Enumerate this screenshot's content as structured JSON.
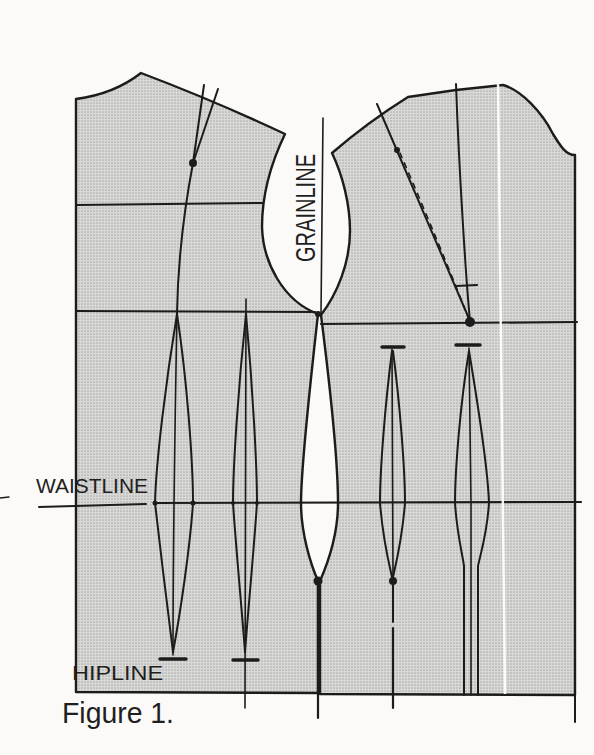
{
  "figure": {
    "caption": "Figure 1.",
    "labels": {
      "grainline": "GRAINLINE",
      "waistline": "WAISTLINE",
      "hipline": "HIPLINE"
    },
    "colors": {
      "paper": "#fbfaf8",
      "pattern_fill_base": "#d9d9d7",
      "pattern_fill_dot": "#adadab",
      "line": "#1c1c1c",
      "text": "#1f1f1f",
      "scan_streak": "#ffffff"
    }
  }
}
